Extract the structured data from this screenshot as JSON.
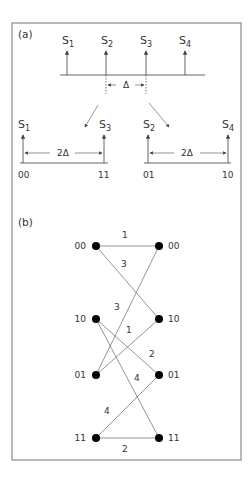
{
  "figure": {
    "panel_a": {
      "label": "(a)",
      "top_axis": {
        "symbols": [
          {
            "base": "S",
            "sub": "1"
          },
          {
            "base": "S",
            "sub": "2"
          },
          {
            "base": "S",
            "sub": "3"
          },
          {
            "base": "S",
            "sub": "4"
          }
        ],
        "spacing_label": "Δ"
      },
      "left_subset": {
        "symbols": [
          {
            "base": "S",
            "sub": "1"
          },
          {
            "base": "S",
            "sub": "3"
          }
        ],
        "spacing_label": "2Δ",
        "codes": [
          "00",
          "11"
        ]
      },
      "right_subset": {
        "symbols": [
          {
            "base": "S",
            "sub": "2"
          },
          {
            "base": "S",
            "sub": "4"
          }
        ],
        "spacing_label": "2Δ",
        "codes": [
          "01",
          "10"
        ]
      }
    },
    "panel_b": {
      "label": "(b)",
      "left_states": [
        "00",
        "10",
        "01",
        "11"
      ],
      "right_states": [
        "00",
        "10",
        "01",
        "11"
      ],
      "edges": [
        {
          "from": "00",
          "to": "00",
          "label": "1"
        },
        {
          "from": "00",
          "to": "10",
          "label": "3"
        },
        {
          "from": "10",
          "to": "01",
          "label": "2"
        },
        {
          "from": "10",
          "to": "11",
          "label": "4"
        },
        {
          "from": "01",
          "to": "00",
          "label": "3"
        },
        {
          "from": "01",
          "to": "10",
          "label": "1"
        },
        {
          "from": "11",
          "to": "01",
          "label": "4"
        },
        {
          "from": "11",
          "to": "11",
          "label": "2"
        }
      ]
    }
  }
}
